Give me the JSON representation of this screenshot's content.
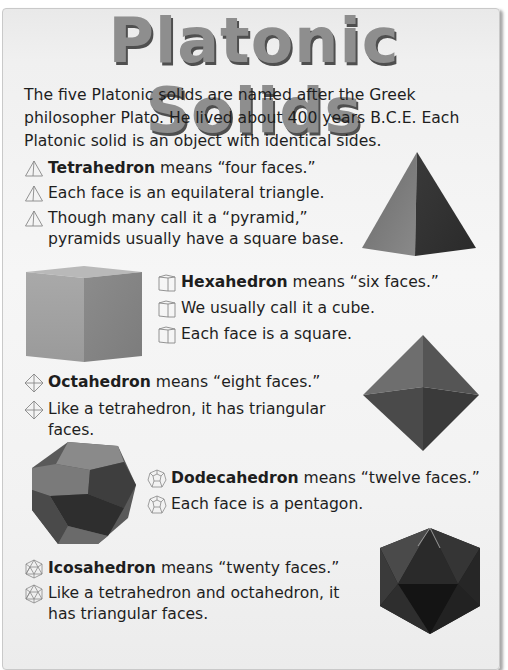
{
  "title": "Platonic Solids",
  "intro": "The five Platonic solids are named after the Greek philosopher Plato. He lived about 400 years B.C.E. Each Platonic solid is an object with identical sides.",
  "sections": {
    "tetrahedron": {
      "icon": "tetrahedron-icon",
      "name": "Tetrahedron",
      "lines": [
        {
          "bold": "Tetrahedron",
          "text": " means “four faces.”"
        },
        {
          "bold": "",
          "text": "Each face is an equilateral triangle."
        },
        {
          "bold": "",
          "text": "Though many call it a “pyramid,” pyramids usually have a square base."
        }
      ]
    },
    "hexahedron": {
      "icon": "cube-icon",
      "name": "Hexahedron",
      "lines": [
        {
          "bold": "Hexahedron",
          "text": " means “six faces.”"
        },
        {
          "bold": "",
          "text": "We usually call it a cube."
        },
        {
          "bold": "",
          "text": "Each face is a square."
        }
      ]
    },
    "octahedron": {
      "icon": "octahedron-icon",
      "name": "Octahedron",
      "lines": [
        {
          "bold": "Octahedron",
          "text": " means “eight faces.”"
        },
        {
          "bold": "",
          "text": "Like a tetrahedron, it has triangular faces."
        }
      ]
    },
    "dodecahedron": {
      "icon": "dodecahedron-icon",
      "name": "Dodecahedron",
      "lines": [
        {
          "bold": "Dodecahedron",
          "text": " means “twelve faces.”"
        },
        {
          "bold": "",
          "text": "Each face is a pentagon."
        }
      ]
    },
    "icosahedron": {
      "icon": "icosahedron-icon",
      "name": "Icosahedron",
      "lines": [
        {
          "bold": "Icosahedron",
          "text": " means “twenty faces.”"
        },
        {
          "bold": "",
          "text": "Like a tetrahedron and octahedron, it has triangular faces."
        }
      ]
    }
  },
  "colors": {
    "title_fill": "#8e8e8e",
    "title_shadow": "#4f4f4f",
    "page_bg": "#f4f4f4",
    "text": "#1e1e1e"
  }
}
